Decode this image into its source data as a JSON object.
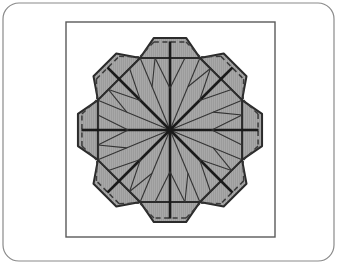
{
  "canvas": {
    "width": 337,
    "height": 264,
    "background_color": "#ffffff"
  },
  "figure": {
    "kind": "line-diagram"
  },
  "frames": {
    "outer_card": {
      "name": "outer-rounded-frame",
      "x": 3,
      "y": 3,
      "width": 331,
      "height": 258,
      "corner_radius": 16,
      "stroke_color": "#8a8a8a",
      "stroke_width": 1.2,
      "fill_color": "#ffffff"
    },
    "inner_border": {
      "name": "inner-square-frame",
      "x": 66,
      "y": 22,
      "width": 209,
      "height": 215,
      "stroke_color": "#5a5a5a",
      "stroke_width": 1.4,
      "fill_color": "#ffffff"
    }
  },
  "colors": {
    "paper_fill": "#9c9c9c",
    "paper_fill_light": "#a8a8a8",
    "paper_fill_dark": "#8e8e8e",
    "outline": "#2b2b2b",
    "crease_mountain": "#1a1a1a",
    "crease_valley": "#3a3a3a",
    "thin_fold": "#333333",
    "frame_outer": "#8a8a8a",
    "frame_inner": "#5a5a5a",
    "background": "#ffffff"
  },
  "geometry": {
    "center": {
      "x": 170,
      "y": 130
    },
    "octagon_circumradius": 78,
    "octagon_inradius": 72,
    "flap_outer_reach": 20,
    "flap_taper": 0.46,
    "num_flaps": 8,
    "num_pinwheel_panels": 8,
    "rotation_offset_deg": 22.5,
    "octagon_vertices": [
      {
        "x": 202,
        "y": 52
      },
      {
        "x": 248,
        "y": 98
      },
      {
        "x": 248,
        "y": 162
      },
      {
        "x": 202,
        "y": 208
      },
      {
        "x": 138,
        "y": 208
      },
      {
        "x": 92,
        "y": 162
      },
      {
        "x": 92,
        "y": 98
      },
      {
        "x": 138,
        "y": 52
      }
    ],
    "span_horizontal": {
      "x_min": 93,
      "x_max": 247
    },
    "span_vertical": {
      "y_min": 52,
      "y_max": 208
    }
  },
  "strokes": {
    "outline_width": 2.0,
    "mountain_width": 2.6,
    "valley_width": 1.5,
    "thin_width": 1.1,
    "dash_pattern": "5,3.5"
  },
  "elements": {
    "flaps_label": "octagon-edge-flaps",
    "pinwheel_label": "radial-pinwheel-panels",
    "center_label": "pinwheel-center-node",
    "chevrons_label": "inner-chevron-creases",
    "dashed_label": "valley-fold-dashed-lines"
  }
}
